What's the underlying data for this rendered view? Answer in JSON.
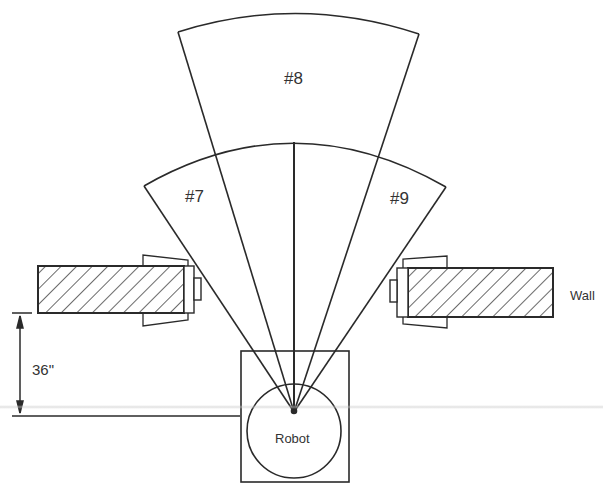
{
  "diagram": {
    "type": "robot sonar sensor coverage schematic",
    "labels": {
      "sector_7": "#7",
      "sector_8": "#8",
      "sector_9": "#9",
      "wall": "Wall",
      "robot": "Robot",
      "dimension": "36\""
    },
    "colors": {
      "stroke": "#2a2a2a",
      "background": "#ffffff",
      "text": "#333333"
    },
    "elements": [
      {
        "id": "sector-8",
        "label": "#8",
        "description": "long-range central sonar cone"
      },
      {
        "id": "sector-7",
        "label": "#7",
        "description": "left short-range sonar cone"
      },
      {
        "id": "sector-9",
        "label": "#9",
        "description": "right short-range sonar cone"
      },
      {
        "id": "left-wall",
        "description": "hatched wall segment with door jamb"
      },
      {
        "id": "right-wall",
        "label": "Wall",
        "description": "hatched wall segment with door jamb"
      },
      {
        "id": "robot",
        "label": "Robot",
        "description": "square robot body with circular base"
      },
      {
        "id": "distance-dimension",
        "label": "36\"",
        "description": "distance from wall to robot sensor"
      }
    ]
  }
}
